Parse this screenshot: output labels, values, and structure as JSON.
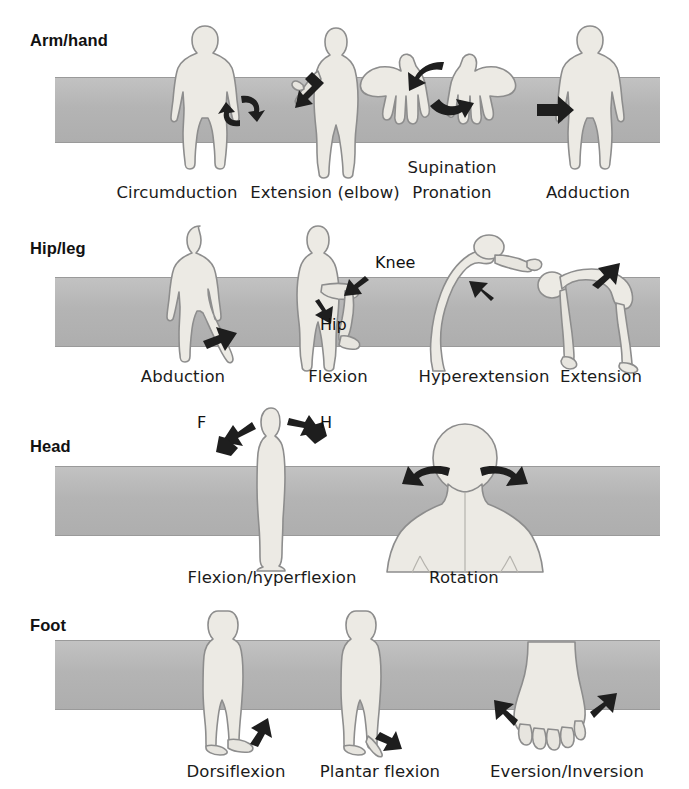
{
  "figure": {
    "band_color": "#b8b8b8",
    "body_color": "#eceae4",
    "arrow_color": "#1e1e1e"
  },
  "sections": [
    {
      "id": "arm-hand",
      "heading": "Arm/hand",
      "captions": [
        {
          "text": "Circumduction"
        },
        {
          "text": "Extension (elbow)"
        },
        {
          "text": "Supination"
        },
        {
          "text": "Pronation"
        },
        {
          "text": "Adduction"
        }
      ]
    },
    {
      "id": "hip-leg",
      "heading": "Hip/leg",
      "captions": [
        {
          "text": "Abduction"
        },
        {
          "text": "Flexion"
        },
        {
          "text": "Hyperextension"
        },
        {
          "text": "Extension"
        }
      ],
      "annotations": [
        {
          "text": "Knee"
        },
        {
          "text": "Hip"
        }
      ]
    },
    {
      "id": "head",
      "heading": "Head",
      "captions": [
        {
          "text": "Flexion/hyperflexion"
        },
        {
          "text": "Rotation"
        }
      ],
      "annotations": [
        {
          "text": "F"
        },
        {
          "text": "H"
        }
      ]
    },
    {
      "id": "foot",
      "heading": "Foot",
      "captions": [
        {
          "text": "Dorsiflexion"
        },
        {
          "text": "Plantar flexion"
        },
        {
          "text": "Eversion/Inversion"
        }
      ]
    }
  ]
}
